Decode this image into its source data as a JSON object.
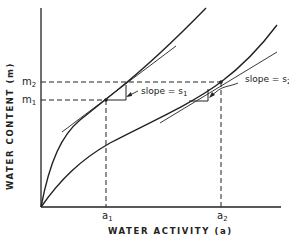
{
  "diagram": {
    "x_axis_label": "WATER ACTIVITY (a)",
    "y_axis_label": "WATER CONTENT (m)",
    "x_ticks": [
      {
        "main": "a",
        "sub": "1"
      },
      {
        "main": "a",
        "sub": "2"
      }
    ],
    "y_ticks": [
      {
        "main": "m",
        "sub": "2"
      },
      {
        "main": "m",
        "sub": "1"
      }
    ],
    "annotations": [
      {
        "text": "slope = s",
        "sub": "1"
      },
      {
        "text": "slope = s",
        "sub": "2"
      }
    ],
    "curves": [
      {
        "name": "upper isotherm",
        "through": "(a1, m1)",
        "tangent_slope": "s1"
      },
      {
        "name": "lower isotherm",
        "through": "(a2, m2)",
        "tangent_slope": "s2"
      }
    ],
    "colors": {
      "line": "#222222",
      "background": "#ffffff"
    }
  }
}
